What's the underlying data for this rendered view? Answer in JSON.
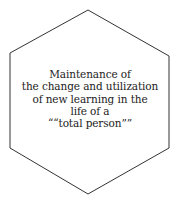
{
  "diagram": {
    "shape": "hexagon",
    "stroke_color": "#333333",
    "text_color": "#222222",
    "lines": [
      "Maintenance of",
      "the change and utilization",
      "of new learning in the",
      "life of a",
      "““total person””"
    ]
  }
}
